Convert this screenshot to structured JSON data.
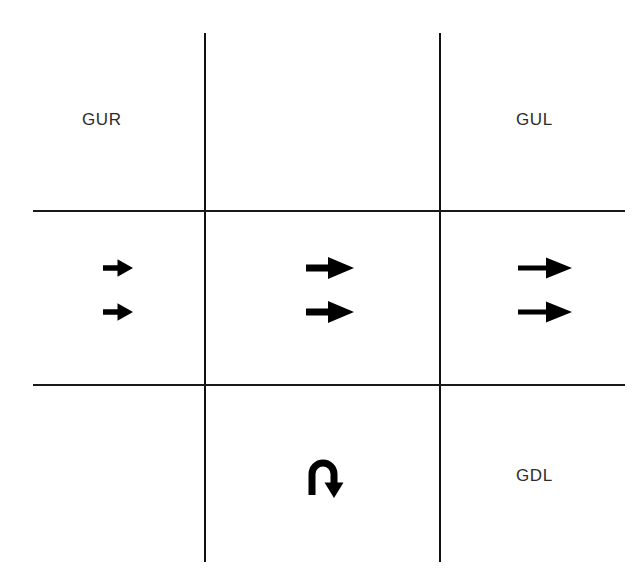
{
  "diagram": {
    "background_color": "#ffffff",
    "line_color": "#111111",
    "label_color": "#2b2b2b",
    "arrow_color": "#000000",
    "grid": {
      "columns": 3,
      "rows": 3,
      "vertical_lines": 2,
      "horizontal_lines": 2
    },
    "labels": {
      "top_left": "GUR",
      "top_right": "GUL",
      "bottom_right": "GDL"
    },
    "arrows": {
      "left_cell": {
        "count": 2,
        "direction": "right",
        "size": "small",
        "icon": "arrow-right-icon"
      },
      "center_cell": {
        "count": 2,
        "direction": "right",
        "size": "medium",
        "icon": "arrow-right-icon"
      },
      "right_cell": {
        "count": 2,
        "direction": "right",
        "size": "large",
        "icon": "arrow-right-icon"
      },
      "bottom_center_cell": {
        "count": 1,
        "direction": "u-turn-down",
        "icon": "arrow-uturn-icon"
      }
    }
  }
}
